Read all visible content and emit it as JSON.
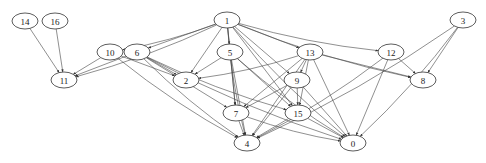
{
  "diagram": {
    "type": "directed-graph",
    "colors": {
      "node_stroke": "#333333",
      "edge": "#444444",
      "background": "#ffffff"
    },
    "nodes": [
      {
        "id": "14",
        "label": "14",
        "x": 25,
        "y": 21
      },
      {
        "id": "16",
        "label": "16",
        "x": 55,
        "y": 21
      },
      {
        "id": "1",
        "label": "1",
        "x": 227,
        "y": 20
      },
      {
        "id": "3",
        "label": "3",
        "x": 463,
        "y": 20
      },
      {
        "id": "10",
        "label": "10",
        "x": 110,
        "y": 52
      },
      {
        "id": "6",
        "label": "6",
        "x": 137,
        "y": 52
      },
      {
        "id": "5",
        "label": "5",
        "x": 230,
        "y": 52
      },
      {
        "id": "13",
        "label": "13",
        "x": 310,
        "y": 52
      },
      {
        "id": "12",
        "label": "12",
        "x": 391,
        "y": 52
      },
      {
        "id": "11",
        "label": "11",
        "x": 64,
        "y": 80
      },
      {
        "id": "2",
        "label": "2",
        "x": 186,
        "y": 80
      },
      {
        "id": "9",
        "label": "9",
        "x": 297,
        "y": 80
      },
      {
        "id": "8",
        "label": "8",
        "x": 423,
        "y": 80
      },
      {
        "id": "7",
        "label": "7",
        "x": 236,
        "y": 113
      },
      {
        "id": "15",
        "label": "15",
        "x": 298,
        "y": 113
      },
      {
        "id": "4",
        "label": "4",
        "x": 247,
        "y": 143
      },
      {
        "id": "0",
        "label": "0",
        "x": 353,
        "y": 143
      }
    ],
    "edges": [
      [
        "14",
        "11"
      ],
      [
        "16",
        "11"
      ],
      [
        "1",
        "11"
      ],
      [
        "1",
        "10"
      ],
      [
        "1",
        "6"
      ],
      [
        "1",
        "2"
      ],
      [
        "1",
        "5"
      ],
      [
        "1",
        "9"
      ],
      [
        "1",
        "13"
      ],
      [
        "1",
        "12"
      ],
      [
        "1",
        "8"
      ],
      [
        "1",
        "7"
      ],
      [
        "1",
        "4"
      ],
      [
        "1",
        "15"
      ],
      [
        "1",
        "0"
      ],
      [
        "3",
        "8"
      ],
      [
        "3",
        "4"
      ],
      [
        "3",
        "0"
      ],
      [
        "10",
        "11"
      ],
      [
        "10",
        "2"
      ],
      [
        "10",
        "4"
      ],
      [
        "6",
        "11"
      ],
      [
        "6",
        "2"
      ],
      [
        "6",
        "4"
      ],
      [
        "6",
        "15"
      ],
      [
        "6",
        "0"
      ],
      [
        "6",
        "7"
      ],
      [
        "5",
        "2"
      ],
      [
        "5",
        "7"
      ],
      [
        "5",
        "4"
      ],
      [
        "5",
        "15"
      ],
      [
        "5",
        "0"
      ],
      [
        "13",
        "2"
      ],
      [
        "13",
        "9"
      ],
      [
        "13",
        "8"
      ],
      [
        "13",
        "7"
      ],
      [
        "13",
        "15"
      ],
      [
        "13",
        "4"
      ],
      [
        "13",
        "0"
      ],
      [
        "12",
        "8"
      ],
      [
        "12",
        "4"
      ],
      [
        "12",
        "0"
      ],
      [
        "9",
        "7"
      ],
      [
        "9",
        "15"
      ],
      [
        "9",
        "4"
      ],
      [
        "9",
        "0"
      ],
      [
        "7",
        "4"
      ],
      [
        "7",
        "0"
      ],
      [
        "15",
        "4"
      ],
      [
        "15",
        "0"
      ]
    ]
  }
}
